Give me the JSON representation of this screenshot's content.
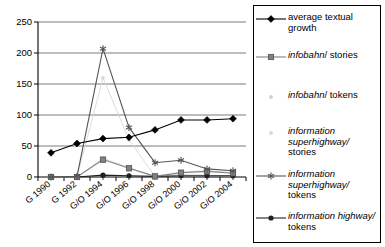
{
  "chart_data": {
    "type": "line",
    "title": "",
    "xlabel": "",
    "ylabel": "",
    "ylim": [
      0,
      250
    ],
    "yticks": [
      0,
      50,
      100,
      150,
      200,
      250
    ],
    "grid": true,
    "legend_position": "right",
    "categories": [
      "G 1990",
      "G 1992",
      "G/O 1994",
      "G/O 1996",
      "G/O 1998",
      "G/O 2000",
      "G/O 2002",
      "G/O 2004"
    ],
    "series": [
      {
        "name": "average textual growth",
        "marker": "diamond",
        "color": "#000000",
        "values": [
          39,
          54,
          62,
          64,
          76,
          92,
          92,
          94
        ]
      },
      {
        "name": "infobahn/ stories",
        "marker": "square",
        "color": "#808080",
        "values": [
          0,
          0,
          28,
          14,
          1,
          7,
          9,
          6
        ]
      },
      {
        "name": "infobahn/ tokens",
        "marker": "dot",
        "color": "#cfcfcf",
        "values": [
          0,
          0,
          30,
          15,
          1,
          8,
          10,
          7
        ]
      },
      {
        "name": "information superhighway/ stories",
        "marker": "dot",
        "color": "#d8d8d8",
        "values": [
          0,
          0,
          160,
          60,
          1,
          4,
          3,
          2
        ]
      },
      {
        "name": "information superhighway/ tokens",
        "marker": "asterisk",
        "color": "#555555",
        "values": [
          0,
          1,
          207,
          80,
          23,
          27,
          13,
          10
        ]
      },
      {
        "name": "information highway/ tokens",
        "marker": "circle",
        "color": "#202020",
        "values": [
          0,
          0,
          3,
          2,
          1,
          2,
          2,
          2
        ]
      }
    ]
  },
  "legend": {
    "items": [
      {
        "id": "average-textual-growth",
        "marker": "diamond",
        "color": "#000000",
        "lines": [
          {
            "text": "average textual",
            "italic": false
          },
          {
            "text": "growth",
            "italic": false
          }
        ]
      },
      {
        "id": "infobahn-stories",
        "marker": "square",
        "color": "#808080",
        "lines": [
          {
            "text": "infobahn",
            "italic": true
          },
          {
            "text": "/ stories",
            "italic": false
          }
        ],
        "inline": true
      },
      {
        "id": "infobahn-tokens",
        "marker": "dot",
        "color": "#cfcfcf",
        "lines": [
          {
            "text": "infobahn",
            "italic": true
          },
          {
            "text": "/ tokens",
            "italic": false
          }
        ],
        "inline": true
      },
      {
        "id": "information-superhighway-stories",
        "marker": "dot",
        "color": "#d8d8d8",
        "lines": [
          {
            "text": "information",
            "italic": true
          },
          {
            "text": "superhighway/",
            "italic": true
          },
          {
            "text": "stories",
            "italic": false
          }
        ]
      },
      {
        "id": "information-superhighway-tokens",
        "marker": "asterisk",
        "color": "#555555",
        "lines": [
          {
            "text": "information",
            "italic": true
          },
          {
            "text": "superhighway/",
            "italic": true
          },
          {
            "text": "tokens",
            "italic": false
          }
        ]
      },
      {
        "id": "information-highway-tokens",
        "marker": "circle",
        "color": "#202020",
        "lines": [
          {
            "text": "information highway/",
            "italic": true
          },
          {
            "text": "tokens",
            "italic": false
          }
        ]
      }
    ]
  }
}
